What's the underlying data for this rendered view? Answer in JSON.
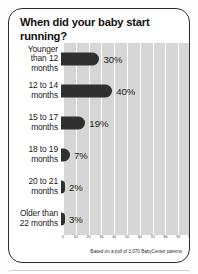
{
  "card": {
    "title": "When did your baby start running?",
    "footnote": "Based on a poll of 3,070 BabyCenter parents"
  },
  "chart_data": {
    "type": "bar",
    "orientation": "horizontal",
    "title": "When did your baby start running?",
    "xlabel": "",
    "ylabel": "",
    "xlim": [
      0,
      100
    ],
    "grid": true,
    "legend": false,
    "bar_color": "#303030",
    "plot_background": "#d6d6d6",
    "gridline_color": "#ffffff",
    "categories": [
      "Younger\nthan 12\nmonths",
      "12 to 14\nmonths",
      "15 to 17\nmonths",
      "18 to 19\nmonths",
      "20 to 21\nmonths",
      "Older than\n22 months"
    ],
    "values": [
      30,
      40,
      19,
      7,
      2,
      3
    ],
    "value_labels": [
      "30%",
      "40%",
      "19%",
      "7%",
      "2%",
      "3%"
    ],
    "xticks": [
      0,
      10,
      20,
      30,
      40,
      50,
      60,
      70,
      80,
      90,
      100
    ],
    "xtick_labels": [
      "0",
      "10",
      "20",
      "30",
      "40",
      "50",
      "60",
      "70",
      "80",
      "90",
      "100"
    ],
    "annotation": "Based on a poll of 3,070 BabyCenter parents"
  }
}
